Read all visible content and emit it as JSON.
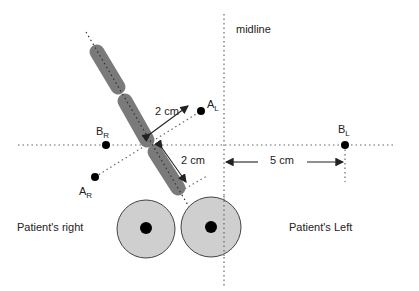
{
  "diagram": {
    "labels": {
      "midline": "midline",
      "patient_right": "Patient's right",
      "patient_left": "Patient's Left",
      "dist_a": "2 cm",
      "dist_b": "2 cm",
      "dist_c": "5 cm"
    },
    "points": [
      {
        "id": "A_L",
        "main": "A",
        "sub": "L"
      },
      {
        "id": "A_R",
        "main": "A",
        "sub": "R"
      },
      {
        "id": "B_R",
        "main": "B",
        "sub": "R"
      },
      {
        "id": "B_L",
        "main": "B",
        "sub": "L"
      }
    ],
    "colors": {
      "capsule": "#7a7a7a",
      "circle_fill": "#cfcfcf",
      "dot": "#000000",
      "line": "#555555"
    }
  }
}
